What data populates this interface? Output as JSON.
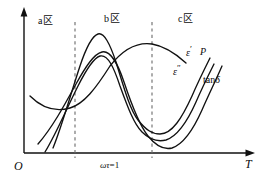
{
  "figure": {
    "type": "line-diagram",
    "background": "#ffffff",
    "ink_color": "#111111",
    "dash_color": "#6a6a6a",
    "axes": {
      "origin_label": "O",
      "x_axis_label": "T",
      "y_axis_label": "",
      "x_tick_label": "ωτ = 1",
      "x_tick_label_parts": {
        "omega_tau": "ωτ",
        "equals_one": "=1"
      }
    },
    "regions": [
      {
        "id": "a",
        "letter": "a",
        "zone_glyph": "区",
        "label": "a 区"
      },
      {
        "id": "b",
        "letter": "b",
        "zone_glyph": "区",
        "label": "b 区"
      },
      {
        "id": "c",
        "letter": "c",
        "zone_glyph": "区",
        "label": "c 区"
      }
    ],
    "dividers": [
      {
        "name": "divider-a-b",
        "x": 75
      },
      {
        "name": "divider-b-c",
        "x": 152
      }
    ],
    "curve_labels": [
      {
        "id": "eps-prime",
        "text": "ε",
        "mark": "′",
        "full": "ε′"
      },
      {
        "id": "p",
        "text": "P",
        "mark": "",
        "full": "P"
      },
      {
        "id": "eps-double-prime",
        "text": "ε",
        "mark": "″",
        "full": "ε″"
      },
      {
        "id": "tan-delta",
        "text": "tan",
        "mark": "δ",
        "full": "tanδ"
      }
    ],
    "curves": [
      {
        "id": "eps-prime-curve",
        "label": "ε′",
        "description": "dips then rises to a broad plateau and declines toward the right",
        "path": "M 30,96 C 42,108 56,112 70,108 C 84,104 96,88 110,66 C 124,48 138,42 152,44 C 164,46 174,52 186,63"
      },
      {
        "id": "p-curve",
        "label": "P",
        "description": "sharp peak near the first divider, deep minimum past the second divider, then rises",
        "path": "M 53,148 C 62,126 70,96 80,66 C 86,48 92,36 98,34 C 104,32 110,44 116,62 C 124,88 130,110 138,120 C 146,130 152,134 160,134 C 172,134 182,118 192,96 C 198,82 204,70 210,58"
      },
      {
        "id": "eps-double-prime-curve",
        "label": "ε″",
        "description": "lower sharp peak, deeper minimum, then rises",
        "path": "M 45,152 C 56,134 66,110 78,86 C 86,70 94,58 100,56 C 108,54 114,68 120,86 C 128,108 134,124 142,132 C 150,140 158,142 166,140 C 178,136 188,120 196,102 C 202,88 208,76 214,64"
      },
      {
        "id": "tan-delta-curve",
        "label": "tanδ",
        "description": "broadest peak and deepest minimum, then steep rise",
        "path": "M 38,144 C 52,128 64,106 76,84 C 86,66 94,54 102,52 C 110,50 118,64 124,82 C 132,106 140,126 148,136 C 156,146 164,150 172,148 C 184,144 194,128 202,110 C 208,96 216,80 222,66"
      }
    ],
    "label_positions": {
      "region_a": {
        "x": 38,
        "y": 16
      },
      "region_b": {
        "x": 104,
        "y": 14
      },
      "region_c": {
        "x": 178,
        "y": 14
      },
      "origin": {
        "x": 14,
        "y": 160
      },
      "x_axis": {
        "x": 245,
        "y": 158
      },
      "x_tick": {
        "x": 100,
        "y": 161
      },
      "eps_prime": {
        "x": 186,
        "y": 45
      },
      "p": {
        "x": 200,
        "y": 47
      },
      "eps_double_prime": {
        "x": 173,
        "y": 64
      },
      "tan_delta": {
        "x": 203,
        "y": 75
      }
    }
  }
}
